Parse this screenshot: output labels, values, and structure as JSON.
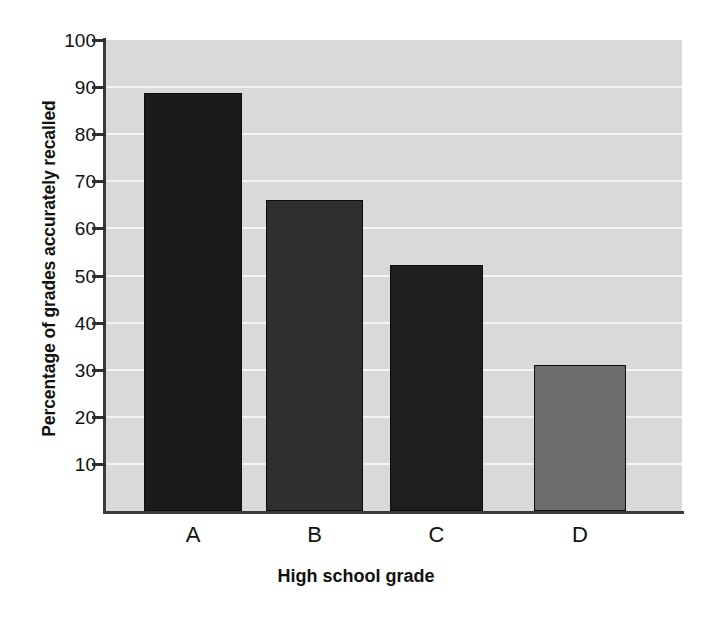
{
  "chart_data": {
    "type": "bar",
    "title": "",
    "subtitle": "",
    "categories": [
      "A",
      "B",
      "C",
      "D"
    ],
    "values": [
      88.8,
      66,
      52.3,
      31
    ],
    "series": [
      {
        "name": "Percentage of grades accurately recalled",
        "values": [
          88.8,
          66,
          52.3,
          31
        ]
      }
    ],
    "xlabel": "High school grade",
    "ylabel": "Percentage of grades accurately recalled",
    "ylim": [
      0,
      100
    ],
    "yticks": [
      10,
      20,
      30,
      40,
      50,
      60,
      70,
      80,
      90,
      100
    ],
    "ytick_labels": [
      "10",
      "20",
      "30",
      "40",
      "50",
      "60",
      "70",
      "80",
      "90",
      "100"
    ],
    "xtick_labels": [
      "A",
      "B",
      "C",
      "D"
    ],
    "grid": true,
    "grid_axis": "y",
    "legend": false,
    "legend_position": "none",
    "bar_colors": [
      "#1b1b1b",
      "#2f2f2f",
      "#1e1e1e",
      "#6d6d6d"
    ],
    "plot_background": "#d9d9d9",
    "gridline_color": "#f4f4f4",
    "axis_color": "#3a3a3a",
    "text_color": "#111111"
  }
}
